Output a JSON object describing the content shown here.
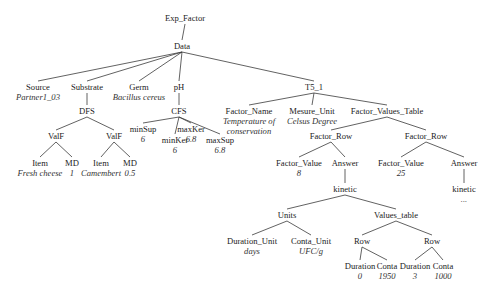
{
  "diagram": {
    "type": "tree",
    "edge_color": "#3a3a3a",
    "nodes": [
      {
        "id": "exp_factor",
        "label": "Exp_Factor",
        "x": 185,
        "y": 13
      },
      {
        "id": "data",
        "label": "Data",
        "x": 182,
        "y": 41,
        "parent": "exp_factor"
      },
      {
        "id": "source",
        "label": "Source",
        "value": "Partner1_03",
        "x": 38,
        "y": 82,
        "parent": "data"
      },
      {
        "id": "substrate",
        "label": "Substrate",
        "x": 87,
        "y": 82,
        "parent": "data"
      },
      {
        "id": "germ",
        "label": "Germ",
        "value": "Bacillus cereus",
        "x": 139,
        "y": 82,
        "parent": "data"
      },
      {
        "id": "ph",
        "label": "pH",
        "x": 179,
        "y": 82,
        "parent": "data"
      },
      {
        "id": "t5_1",
        "label": "T5_1",
        "x": 314,
        "y": 82,
        "parent": "data"
      },
      {
        "id": "dfs",
        "label": "DFS",
        "x": 87,
        "y": 106,
        "parent": "substrate"
      },
      {
        "id": "cfs",
        "label": "CFS",
        "x": 179,
        "y": 106,
        "parent": "ph"
      },
      {
        "id": "factor_name",
        "label": "Factor_Name",
        "value": "Temperature of conservation",
        "x": 249,
        "y": 106,
        "parent": "t5_1"
      },
      {
        "id": "mesure_unit",
        "label": "Mesure_Unit",
        "value": "Celsus Degree",
        "x": 312,
        "y": 106,
        "parent": "t5_1"
      },
      {
        "id": "factor_values_table",
        "label": "Factor_Values_Table",
        "x": 387,
        "y": 106,
        "parent": "t5_1"
      },
      {
        "id": "valf1",
        "label": "ValF",
        "x": 56,
        "y": 131,
        "parent": "dfs"
      },
      {
        "id": "valf2",
        "label": "ValF",
        "x": 114,
        "y": 131,
        "parent": "dfs"
      },
      {
        "id": "minsup",
        "label": "minSup",
        "value": "6",
        "x": 143,
        "y": 124,
        "parent": "cfs"
      },
      {
        "id": "minker",
        "label": "minKer",
        "value": "6",
        "x": 175,
        "y": 135,
        "parent": "cfs"
      },
      {
        "id": "maxker",
        "label": "maxKer",
        "value": "6.8",
        "x": 191,
        "y": 124,
        "parent": "cfs"
      },
      {
        "id": "maxsup",
        "label": "maxSup",
        "value": "6.8",
        "x": 220,
        "y": 135,
        "parent": "cfs"
      },
      {
        "id": "item1",
        "label": "Item",
        "value": "Fresh cheese",
        "x": 40,
        "y": 158,
        "parent": "valf1"
      },
      {
        "id": "md1",
        "label": "MD",
        "value": "1",
        "x": 72,
        "y": 158,
        "parent": "valf1"
      },
      {
        "id": "item2",
        "label": "Item",
        "value": "Camembert",
        "x": 101,
        "y": 158,
        "parent": "valf2"
      },
      {
        "id": "md2",
        "label": "MD",
        "value": "0.5",
        "x": 130,
        "y": 158,
        "parent": "valf2"
      },
      {
        "id": "factor_row1",
        "label": "Factor_Row",
        "x": 331,
        "y": 131,
        "parent": "factor_values_table"
      },
      {
        "id": "factor_row2",
        "label": "Factor_Row",
        "x": 426,
        "y": 131,
        "parent": "factor_values_table"
      },
      {
        "id": "factor_value1",
        "label": "Factor_Value",
        "value": "8",
        "x": 299,
        "y": 158,
        "parent": "factor_row1"
      },
      {
        "id": "answer1",
        "label": "Answer",
        "x": 345,
        "y": 158,
        "parent": "factor_row1"
      },
      {
        "id": "factor_value2",
        "label": "Factor_Value",
        "value": "25",
        "x": 401,
        "y": 158,
        "parent": "factor_row2"
      },
      {
        "id": "answer2",
        "label": "Answer",
        "x": 464,
        "y": 158,
        "parent": "factor_row2"
      },
      {
        "id": "kinetic1",
        "label": "kinetic",
        "x": 345,
        "y": 184,
        "parent": "answer1"
      },
      {
        "id": "kinetic2",
        "label": "kinetic",
        "value": "...",
        "x": 464,
        "y": 184,
        "parent": "answer2"
      },
      {
        "id": "units",
        "label": "Units",
        "x": 287,
        "y": 210,
        "parent": "kinetic1"
      },
      {
        "id": "values_table",
        "label": "Values_table",
        "x": 396,
        "y": 210,
        "parent": "kinetic1"
      },
      {
        "id": "duration_unit",
        "label": "Duration_Unit",
        "value": "days",
        "x": 252,
        "y": 236,
        "parent": "units"
      },
      {
        "id": "conta_unit",
        "label": "Conta_Unit",
        "value": "UFC/g",
        "x": 311,
        "y": 236,
        "parent": "units"
      },
      {
        "id": "row1",
        "label": "Row",
        "x": 362,
        "y": 236,
        "parent": "values_table"
      },
      {
        "id": "row2",
        "label": "Row",
        "x": 432,
        "y": 236,
        "parent": "values_table"
      },
      {
        "id": "duration1",
        "label": "Duration",
        "value": "0",
        "x": 360,
        "y": 261,
        "parent": "row1"
      },
      {
        "id": "conta1",
        "label": "Conta",
        "value": "1950",
        "x": 387,
        "y": 261,
        "parent": "row1"
      },
      {
        "id": "duration2",
        "label": "Duration",
        "value": "3",
        "x": 415,
        "y": 261,
        "parent": "row2"
      },
      {
        "id": "conta2",
        "label": "Conta",
        "value": "1000",
        "x": 443,
        "y": 261,
        "parent": "row2"
      }
    ]
  }
}
